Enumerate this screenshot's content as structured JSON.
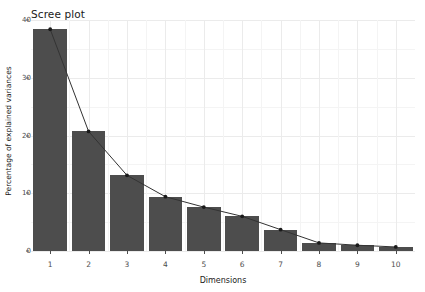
{
  "chart_data": {
    "type": "bar",
    "title": "Scree plot",
    "xlabel": "Dimensions",
    "ylabel": "Percentage of explained variances",
    "categories": [
      "1",
      "2",
      "3",
      "4",
      "5",
      "6",
      "7",
      "8",
      "9",
      "10"
    ],
    "values": [
      38.4,
      20.7,
      13.1,
      9.4,
      7.6,
      6.0,
      3.7,
      1.4,
      1.0,
      0.7
    ],
    "series": [
      {
        "name": "Percentage of explained variances",
        "values": [
          38.4,
          20.7,
          13.1,
          9.4,
          7.6,
          6.0,
          3.7,
          1.4,
          1.0,
          0.7
        ]
      }
    ],
    "overlay": {
      "type": "line",
      "marker": "point",
      "x": [
        "1",
        "2",
        "3",
        "4",
        "5",
        "6",
        "7",
        "8",
        "9",
        "10"
      ],
      "values": [
        38.4,
        20.7,
        13.1,
        9.4,
        7.6,
        6.0,
        3.7,
        1.4,
        1.0,
        0.7
      ]
    },
    "ylim": [
      0,
      40
    ],
    "yticks": [
      0,
      10,
      20,
      30,
      40
    ],
    "ytick_labels": [
      "0",
      "10",
      "20",
      "30",
      "40"
    ],
    "yminor": [
      5,
      15,
      25,
      35
    ],
    "grid": true,
    "legend": "none",
    "colors": {
      "bar_fill": "#4d4d4d",
      "line": "#333333",
      "point": "#1a1a1a",
      "grid_major": "#ebebeb",
      "grid_minor": "#f4f4f4",
      "background": "#ffffff",
      "text": "#1a1a1a",
      "tick_text": "#4d4d4d"
    }
  }
}
